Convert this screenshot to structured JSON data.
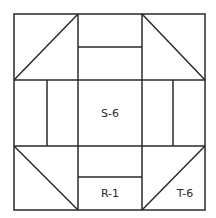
{
  "diagram": {
    "type": "quilt-block",
    "stroke_color": "#2a2a2a",
    "background": "#ffffff",
    "labels": {
      "center": "S-6",
      "bottom_rect": "R-1",
      "bottom_right_triangle": "T-6"
    }
  }
}
